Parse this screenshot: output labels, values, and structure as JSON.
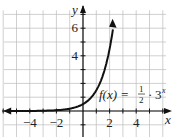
{
  "chart_data": {
    "type": "line",
    "title": "",
    "function_label": "f(x) = 1/2 · 3^x",
    "function_parts": {
      "name": "f(x) =",
      "numerator": "1",
      "denominator": "2",
      "dot": "·",
      "base": "3",
      "exponent": "x"
    },
    "xlabel": "x",
    "ylabel": "y",
    "xlim": [
      -6,
      6.5
    ],
    "ylim": [
      -1.5,
      7.5
    ],
    "x_ticks": [
      -4,
      -2,
      2,
      4
    ],
    "x_tick_labels": [
      "−4",
      "−2",
      "2",
      "4"
    ],
    "y_ticks": [
      4,
      6
    ],
    "y_tick_labels": [
      "4",
      "6"
    ],
    "grid": true,
    "series": [
      {
        "name": "f(x) = 1/2 · 3^x",
        "x": [
          -6,
          -4,
          -3,
          -2,
          -1,
          0,
          0.5,
          1,
          1.5,
          2,
          2.3
        ],
        "values": [
          0.0007,
          0.006,
          0.019,
          0.056,
          0.167,
          0.5,
          0.866,
          1.5,
          2.598,
          4.5,
          6.3
        ]
      }
    ]
  }
}
